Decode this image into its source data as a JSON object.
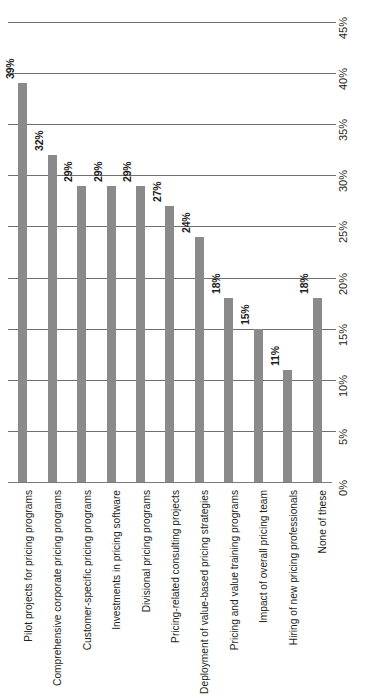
{
  "chart_data": {
    "type": "bar",
    "title": "",
    "subtitle": "",
    "xlabel": "",
    "ylabel": "",
    "orientation": "vertical",
    "grid": true,
    "legend": false,
    "legend_position": "none",
    "y_axis_position": "right",
    "y_axis_rotated": true,
    "ylim": [
      0,
      45
    ],
    "ytick_step": 5,
    "categories": [
      "Pilot projects for pricing programs",
      "Comprehensive corporate pricing programs",
      "Customer-specific pricing programs",
      "Investments in pricing software",
      "Divisional pricing programs",
      "Pricing-related consulting projects",
      "Deployment of value-based pricing strategies",
      "Pricing and value training programs",
      "Impact of overall pricing team",
      "Hiring of new pricing professionals",
      "None of these"
    ],
    "values": [
      39,
      32,
      29,
      29,
      29,
      27,
      24,
      18,
      15,
      11,
      18
    ],
    "value_labels": [
      "39%",
      "32%",
      "29%",
      "29%",
      "29%",
      "27%",
      "24%",
      "18%",
      "15%",
      "11%",
      "18%"
    ],
    "ytick_labels": [
      "0%",
      "5%",
      "10%",
      "15%",
      "20%",
      "25%",
      "30%",
      "35%",
      "40%",
      "45%"
    ],
    "ytick_values": [
      0,
      5,
      10,
      15,
      20,
      25,
      30,
      35,
      40,
      45
    ],
    "colors": {
      "bar": "#8a8a8a",
      "gridline": "#6f6f6f",
      "text": "#231f20",
      "background": "#ffffff"
    }
  },
  "source_note": ""
}
